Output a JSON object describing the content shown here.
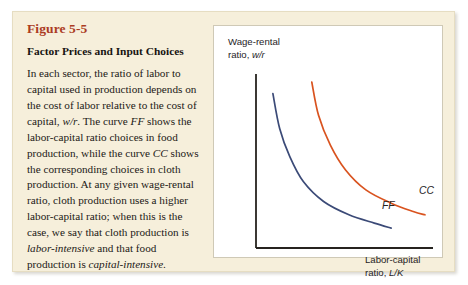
{
  "figure": {
    "number_label": "Figure 5-5",
    "subtitle": "Factor Prices and Input Choices",
    "body_text": "In each sector, the ratio of labor to capital used in production depends on the cost of labor relative to the cost of capital, w/r. The curve FF shows the labor-capital ratio choices in food production, while the curve CC shows the corresponding choices in cloth production. At any given wage-rental ratio, cloth production uses a higher labor-capital ratio; when this is the case, we say that cloth production is labor-intensive and that food production is capital-intensive.",
    "body_runs": [
      {
        "text": "In each sector, the ratio of labor to capital used in production depends on the cost of labor relative to the cost of capital, ",
        "style": "normal"
      },
      {
        "text": "w/r",
        "style": "italic"
      },
      {
        "text": ". The curve ",
        "style": "normal"
      },
      {
        "text": "FF",
        "style": "italic"
      },
      {
        "text": " shows the labor-capital ratio choices in food production, while the curve ",
        "style": "normal"
      },
      {
        "text": "CC",
        "style": "italic"
      },
      {
        "text": " shows the corresponding choices in cloth production. At any given wage-rental ratio, cloth production uses a higher labor-capital ratio; when this is the case, we say that cloth production is ",
        "style": "normal"
      },
      {
        "text": "labor-intensive",
        "style": "italic"
      },
      {
        "text": " and that food production is ",
        "style": "normal"
      },
      {
        "text": "capital-intensive",
        "style": "italic"
      },
      {
        "text": ".",
        "style": "normal"
      }
    ],
    "colors": {
      "panel_background": "#f6efdb",
      "panel_border": "#e6ddc2",
      "figure_number": "#ab3c23",
      "plot_background": "#ffffff",
      "axis": "#26231f",
      "cc_curve": "#d9531f",
      "ff_curve": "#3b4a77"
    }
  },
  "chart_data": {
    "type": "line",
    "title": "",
    "xlabel_line1": "Labor-capital",
    "xlabel_line2_prefix": "ratio, ",
    "xlabel_line2_symbol": "L/K",
    "ylabel_line1": "Wage-rental",
    "ylabel_line2_prefix": "ratio, ",
    "ylabel_line2_symbol": "w/r",
    "grid": false,
    "legend_position": "inline-end-of-curve",
    "axis_ticks": [],
    "xlim": [
      0,
      1
    ],
    "ylim": [
      0,
      1
    ],
    "series": [
      {
        "name": "FF",
        "label": "FF",
        "color": "#3b4a77",
        "description": "labor-capital ratio choices in food production; convex decreasing curve lying left of CC",
        "points": [
          {
            "x": 0.1,
            "y": 0.93
          },
          {
            "x": 0.14,
            "y": 0.72
          },
          {
            "x": 0.2,
            "y": 0.55
          },
          {
            "x": 0.28,
            "y": 0.4
          },
          {
            "x": 0.4,
            "y": 0.28
          },
          {
            "x": 0.55,
            "y": 0.2
          },
          {
            "x": 0.7,
            "y": 0.15
          },
          {
            "x": 0.8,
            "y": 0.12
          }
        ],
        "label_point": {
          "x": 0.745,
          "y": 0.235
        }
      },
      {
        "name": "CC",
        "label": "CC",
        "color": "#d9531f",
        "description": "labor-capital ratio choices in cloth production; convex decreasing curve lying right of FF (higher labor-capital ratio at any wage-rental ratio)",
        "points": [
          {
            "x": 0.33,
            "y": 1.0
          },
          {
            "x": 0.37,
            "y": 0.8
          },
          {
            "x": 0.44,
            "y": 0.62
          },
          {
            "x": 0.53,
            "y": 0.47
          },
          {
            "x": 0.65,
            "y": 0.35
          },
          {
            "x": 0.8,
            "y": 0.27
          },
          {
            "x": 0.93,
            "y": 0.22
          },
          {
            "x": 1.0,
            "y": 0.2
          }
        ],
        "label_point": {
          "x": 0.965,
          "y": 0.325
        }
      }
    ]
  }
}
